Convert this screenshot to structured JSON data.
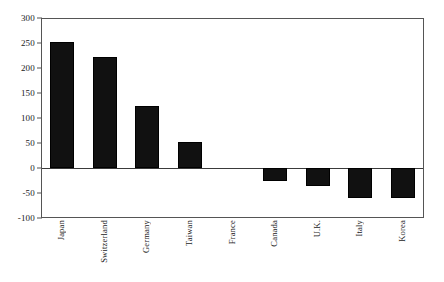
{
  "chart_data": {
    "type": "bar",
    "title": "",
    "xlabel": "",
    "ylabel": "",
    "categories": [
      "Japan",
      "Switzerland",
      "Germany",
      "Taiwan",
      "France",
      "Canada",
      "U.K.",
      "Italy",
      "Korea"
    ],
    "values": [
      253,
      222,
      124,
      52,
      0,
      -26,
      -36,
      -60,
      -60
    ],
    "ylim": [
      -100,
      300
    ],
    "yticks": [
      300,
      250,
      200,
      150,
      100,
      50,
      0,
      -50,
      -100
    ],
    "ytick_labels": [
      "300",
      "250",
      "200",
      "150",
      "100",
      "50",
      "0",
      "-50",
      "-100"
    ],
    "grid": false,
    "legend": false,
    "bar_color": "#111111",
    "frame_color": "#555555",
    "zero_line": 0
  }
}
